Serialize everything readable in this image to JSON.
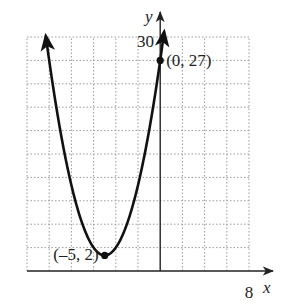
{
  "chart_data": {
    "type": "line",
    "title": "",
    "xlabel": "x",
    "ylabel": "y",
    "xlim": [
      -12,
      8
    ],
    "ylim": [
      0,
      30
    ],
    "x_grid_step": 2,
    "y_grid_step": 3,
    "grid": true,
    "tick_labels": {
      "x_max": "8",
      "y_max": "30"
    },
    "series": [
      {
        "name": "parabola",
        "equation": "y = (x + 5)^2 + 2",
        "x_range": [
          -10.3,
          0.35
        ],
        "arrows_at_ends": true
      }
    ],
    "points": [
      {
        "x": -5,
        "y": 2,
        "label": "(–5, 2)"
      },
      {
        "x": 0,
        "y": 27,
        "label": "(0, 27)"
      }
    ],
    "colors": {
      "curve": "#111111",
      "grid": "#9a9a9a",
      "axis": "#222222"
    }
  }
}
